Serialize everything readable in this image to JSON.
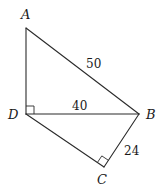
{
  "diagram": {
    "type": "geometry",
    "vertices": [
      {
        "id": "A",
        "label": "A",
        "x": 26,
        "y": 28,
        "lx": 25,
        "ly": 19
      },
      {
        "id": "D",
        "label": "D",
        "x": 26,
        "y": 114,
        "lx": 14,
        "ly": 119
      },
      {
        "id": "B",
        "label": "B",
        "x": 139,
        "y": 114,
        "lx": 151,
        "ly": 119
      },
      {
        "id": "C",
        "label": "C",
        "x": 104,
        "y": 167,
        "lx": 102,
        "ly": 184
      }
    ],
    "segments": [
      {
        "from": "A",
        "to": "D"
      },
      {
        "from": "A",
        "to": "B",
        "length_label": "50",
        "lx": 93,
        "ly": 68
      },
      {
        "from": "D",
        "to": "B",
        "length_label": "40",
        "lx": 80,
        "ly": 110
      },
      {
        "from": "D",
        "to": "C"
      },
      {
        "from": "C",
        "to": "B",
        "length_label": "24",
        "lx": 131,
        "ly": 155
      }
    ],
    "right_angles": [
      {
        "at": "D",
        "between": [
          "A",
          "B"
        ]
      },
      {
        "at": "C",
        "between": [
          "D",
          "B"
        ]
      }
    ]
  },
  "labels": {
    "A": "A",
    "B": "B",
    "C": "C",
    "D": "D",
    "AB": "50",
    "DB": "40",
    "CB": "24"
  }
}
